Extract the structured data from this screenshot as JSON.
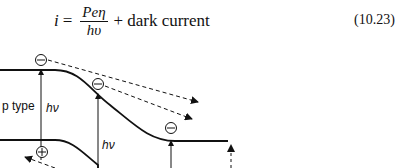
{
  "equation": {
    "lhs": "i",
    "equals": "=",
    "numerator": "Peη",
    "denominator": "hυ",
    "plus": "+",
    "term": "dark current",
    "number": "(10.23)"
  },
  "diagram": {
    "region_label": "p type",
    "photon_label_1": "hν",
    "photon_label_2": "hν",
    "electron_symbol": "⊖",
    "hole_symbol": "⊕"
  }
}
